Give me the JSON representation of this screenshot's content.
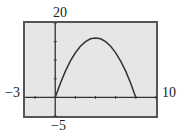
{
  "chart_data": {
    "type": "line",
    "title": "",
    "xlabel": "",
    "ylabel": "",
    "xlim": [
      -3,
      10
    ],
    "ylim": [
      -5,
      20
    ],
    "x_window_labels": {
      "min": "−3",
      "max": "10"
    },
    "y_window_labels": {
      "min": "−5",
      "max": "20"
    },
    "x_tick_step": 2,
    "y_tick_step": 5,
    "grid": false,
    "legend": null,
    "series": [
      {
        "name": "y = -x^2 + 8x",
        "x": [
          0,
          0.5,
          1,
          1.5,
          2,
          2.5,
          3,
          3.5,
          4,
          4.5,
          5,
          5.5,
          6,
          6.5,
          7,
          7.5,
          8
        ],
        "y": [
          0,
          3.75,
          7,
          9.75,
          12,
          13.75,
          15,
          15.75,
          16,
          15.75,
          15,
          13.75,
          12,
          9.75,
          7,
          3.75,
          0
        ]
      }
    ]
  },
  "labels": {
    "ymax": "20",
    "ymin": "−5",
    "xmin": "−3",
    "xmax": "10"
  },
  "colors": {
    "plot_bg": "#e6e6e6",
    "frame": "#555555",
    "axis": "#333333",
    "curve": "#333333"
  }
}
